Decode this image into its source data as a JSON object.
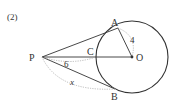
{
  "problem": {
    "number_label": "(2)"
  },
  "points": {
    "P": {
      "label": "P",
      "x": 42,
      "y": 57
    },
    "O": {
      "label": "O",
      "x": 132,
      "y": 57
    },
    "A": {
      "label": "A",
      "x": 118,
      "y": 28
    },
    "B": {
      "label": "B",
      "x": 115,
      "y": 89
    },
    "C": {
      "label": "C",
      "x": 96,
      "y": 57
    }
  },
  "circle": {
    "cx": 132,
    "cy": 57,
    "r": 36
  },
  "measures": {
    "radius_label": "4",
    "pc_label": "6",
    "pb_label": "x"
  },
  "colors": {
    "stroke": "#333333",
    "dotted": "#aaaaaa",
    "background": "#ffffff"
  }
}
